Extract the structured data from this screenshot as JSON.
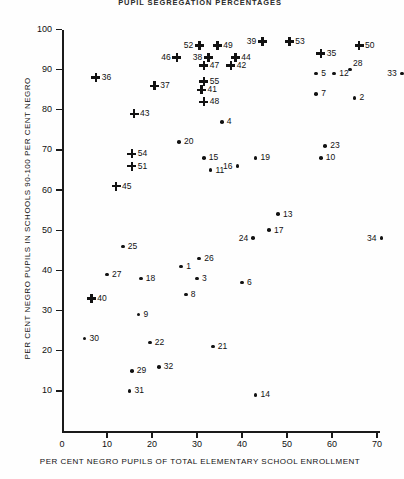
{
  "chart": {
    "title": "PUPIL SEGREGATION PERCENTAGES",
    "xlabel": "PER CENT NEGRO PUPILS OF TOTAL ELEMENTARY SCHOOL ENROLLMENT",
    "ylabel": "PER CENT NEGRO PUPILS IN SCHOOLS 90-100 PER CENT NEGRO"
  },
  "axes": {
    "x_ticks": [
      "0",
      "10",
      "20",
      "30",
      "40",
      "50",
      "60",
      "70"
    ],
    "y_ticks": [
      "10",
      "20",
      "30",
      "40",
      "50",
      "60",
      "70",
      "80",
      "90",
      "100"
    ]
  },
  "chart_data": {
    "type": "scatter",
    "title": "PUPIL SEGREGATION PERCENTAGES",
    "xlabel": "PER CENT NEGRO PUPILS OF TOTAL ELEMENTARY SCHOOL ENROLLMENT",
    "ylabel": "PER CENT NEGRO PUPILS IN SCHOOLS 90-100 PER CENT NEGRO",
    "xlim": [
      0,
      78
    ],
    "ylim": [
      0,
      100
    ],
    "grid": false,
    "legend": null,
    "marker_types": [
      "cross",
      "dot"
    ],
    "points": [
      {
        "label": "36",
        "x": 7.5,
        "y": 88,
        "marker": "cross",
        "lpos": "right"
      },
      {
        "label": "46",
        "x": 25.5,
        "y": 93,
        "marker": "cross",
        "lpos": "left"
      },
      {
        "label": "52",
        "x": 30.5,
        "y": 96,
        "marker": "cross",
        "lpos": "left"
      },
      {
        "label": "49",
        "x": 34.5,
        "y": 96,
        "marker": "cross",
        "lpos": "right"
      },
      {
        "label": "38",
        "x": 32.5,
        "y": 93,
        "marker": "cross",
        "lpos": "left"
      },
      {
        "label": "44",
        "x": 38.5,
        "y": 93,
        "marker": "cross",
        "lpos": "right"
      },
      {
        "label": "47",
        "x": 31.5,
        "y": 91,
        "marker": "cross",
        "lpos": "right"
      },
      {
        "label": "42",
        "x": 37.5,
        "y": 91,
        "marker": "cross",
        "lpos": "right"
      },
      {
        "label": "39",
        "x": 44.5,
        "y": 97,
        "marker": "cross",
        "lpos": "left"
      },
      {
        "label": "53",
        "x": 50.5,
        "y": 97,
        "marker": "cross",
        "lpos": "right"
      },
      {
        "label": "35",
        "x": 57.5,
        "y": 94,
        "marker": "cross",
        "lpos": "right"
      },
      {
        "label": "50",
        "x": 66.0,
        "y": 96,
        "marker": "cross",
        "lpos": "right"
      },
      {
        "label": "55",
        "x": 31.5,
        "y": 87,
        "marker": "cross",
        "lpos": "right"
      },
      {
        "label": "37",
        "x": 20.5,
        "y": 86,
        "marker": "cross",
        "lpos": "right"
      },
      {
        "label": "41",
        "x": 31.0,
        "y": 85,
        "marker": "cross",
        "lpos": "right"
      },
      {
        "label": "48",
        "x": 31.5,
        "y": 82,
        "marker": "cross",
        "lpos": "right"
      },
      {
        "label": "43",
        "x": 16.0,
        "y": 79,
        "marker": "cross",
        "lpos": "right"
      },
      {
        "label": "54",
        "x": 15.5,
        "y": 69,
        "marker": "cross",
        "lpos": "right"
      },
      {
        "label": "51",
        "x": 15.5,
        "y": 66,
        "marker": "cross",
        "lpos": "right"
      },
      {
        "label": "45",
        "x": 12.0,
        "y": 61,
        "marker": "cross",
        "lpos": "right"
      },
      {
        "label": "40",
        "x": 6.5,
        "y": 33,
        "marker": "cross",
        "lpos": "right"
      },
      {
        "label": "5",
        "x": 56.5,
        "y": 89,
        "marker": "dot",
        "lpos": "right"
      },
      {
        "label": "12",
        "x": 60.5,
        "y": 89,
        "marker": "dot",
        "lpos": "right"
      },
      {
        "label": "28",
        "x": 64.0,
        "y": 90,
        "marker": "dot",
        "lpos": "above"
      },
      {
        "label": "33",
        "x": 75.5,
        "y": 89,
        "marker": "dot",
        "lpos": "left"
      },
      {
        "label": "7",
        "x": 56.5,
        "y": 84,
        "marker": "dot",
        "lpos": "right"
      },
      {
        "label": "2",
        "x": 65.0,
        "y": 83,
        "marker": "dot",
        "lpos": "right"
      },
      {
        "label": "4",
        "x": 35.5,
        "y": 77,
        "marker": "dot",
        "lpos": "right"
      },
      {
        "label": "20",
        "x": 26.0,
        "y": 72,
        "marker": "dot",
        "lpos": "right"
      },
      {
        "label": "23",
        "x": 58.5,
        "y": 71,
        "marker": "dot",
        "lpos": "right"
      },
      {
        "label": "10",
        "x": 57.5,
        "y": 68,
        "marker": "dot",
        "lpos": "right"
      },
      {
        "label": "15",
        "x": 31.5,
        "y": 68,
        "marker": "dot",
        "lpos": "right"
      },
      {
        "label": "19",
        "x": 43.0,
        "y": 68,
        "marker": "dot",
        "lpos": "right"
      },
      {
        "label": "16",
        "x": 39.0,
        "y": 66,
        "marker": "dot",
        "lpos": "left"
      },
      {
        "label": "11",
        "x": 33.0,
        "y": 65,
        "marker": "dot",
        "lpos": "right"
      },
      {
        "label": "13",
        "x": 48.0,
        "y": 54,
        "marker": "dot",
        "lpos": "right"
      },
      {
        "label": "17",
        "x": 46.0,
        "y": 50,
        "marker": "dot",
        "lpos": "right"
      },
      {
        "label": "24",
        "x": 42.5,
        "y": 48,
        "marker": "dot",
        "lpos": "left"
      },
      {
        "label": "34",
        "x": 71.0,
        "y": 48,
        "marker": "dot",
        "lpos": "left"
      },
      {
        "label": "25",
        "x": 13.5,
        "y": 46,
        "marker": "dot",
        "lpos": "right"
      },
      {
        "label": "26",
        "x": 30.5,
        "y": 43,
        "marker": "dot",
        "lpos": "right"
      },
      {
        "label": "1",
        "x": 26.5,
        "y": 41,
        "marker": "dot",
        "lpos": "right"
      },
      {
        "label": "27",
        "x": 10.0,
        "y": 39,
        "marker": "dot",
        "lpos": "right"
      },
      {
        "label": "18",
        "x": 17.5,
        "y": 38,
        "marker": "dot",
        "lpos": "right"
      },
      {
        "label": "3",
        "x": 30.0,
        "y": 38,
        "marker": "dot",
        "lpos": "right"
      },
      {
        "label": "6",
        "x": 40.0,
        "y": 37,
        "marker": "dot",
        "lpos": "right"
      },
      {
        "label": "8",
        "x": 27.5,
        "y": 34,
        "marker": "dot",
        "lpos": "right"
      },
      {
        "label": "9",
        "x": 17.0,
        "y": 29,
        "marker": "dot",
        "lpos": "right"
      },
      {
        "label": "30",
        "x": 5.0,
        "y": 23,
        "marker": "dot",
        "lpos": "right"
      },
      {
        "label": "22",
        "x": 19.5,
        "y": 22,
        "marker": "dot",
        "lpos": "right"
      },
      {
        "label": "21",
        "x": 33.5,
        "y": 21,
        "marker": "dot",
        "lpos": "right"
      },
      {
        "label": "29",
        "x": 15.5,
        "y": 15,
        "marker": "dot",
        "lpos": "right"
      },
      {
        "label": "32",
        "x": 21.5,
        "y": 16,
        "marker": "dot",
        "lpos": "right"
      },
      {
        "label": "31",
        "x": 15.0,
        "y": 10,
        "marker": "dot",
        "lpos": "right"
      },
      {
        "label": "14",
        "x": 43.0,
        "y": 9,
        "marker": "dot",
        "lpos": "right"
      }
    ]
  }
}
